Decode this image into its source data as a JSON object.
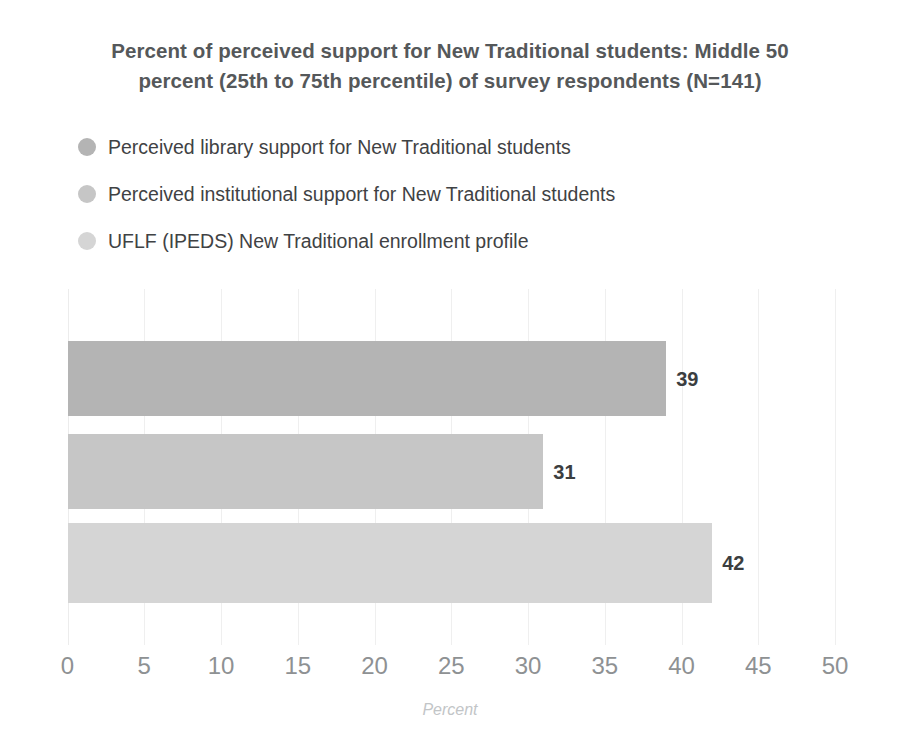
{
  "chart_data": {
    "type": "bar",
    "orientation": "horizontal",
    "title": "Percent of perceived support for New Traditional students: Middle 50 percent (25th to 75th percentile) of survey respondents (N=141)",
    "title_line1": "Percent of perceived support for New Traditional students: Middle 50",
    "title_line2": "percent (25th to 75th percentile) of survey respondents (N=141)",
    "categories": [
      "Perceived library support for New Traditional students",
      "Perceived institutional support for New Traditional students",
      "UFLF (IPEDS) New Traditional enrollment profile"
    ],
    "values": [
      39,
      31,
      42
    ],
    "value_labels": [
      "39",
      "31",
      "42"
    ],
    "colors": [
      "#b4b4b4",
      "#c6c6c6",
      "#d5d5d5"
    ],
    "xlabel": "Percent",
    "ylabel": "",
    "xlim": [
      0,
      50
    ],
    "xticks": [
      0,
      5,
      10,
      15,
      20,
      25,
      30,
      35,
      40,
      45,
      50
    ],
    "xtick_labels": [
      "0",
      "5",
      "10",
      "15",
      "20",
      "25",
      "30",
      "35",
      "40",
      "45",
      "50"
    ],
    "grid": "vertical",
    "legend_position": "top-left",
    "legend": [
      {
        "label": "Perceived library support for New Traditional students",
        "color": "#b4b4b4"
      },
      {
        "label": "Perceived institutional support for New Traditional students",
        "color": "#c6c6c6"
      },
      {
        "label": "UFLF (IPEDS) New Traditional enrollment profile",
        "color": "#d5d5d5"
      }
    ]
  },
  "colors": {
    "title": "#55585a",
    "legend_text": "#3f4244",
    "value_label": "#3b3e40",
    "tick_label": "#8e9193",
    "axis_label": "#c2c5c7",
    "gridline": "#efefef",
    "background": "#ffffff"
  }
}
